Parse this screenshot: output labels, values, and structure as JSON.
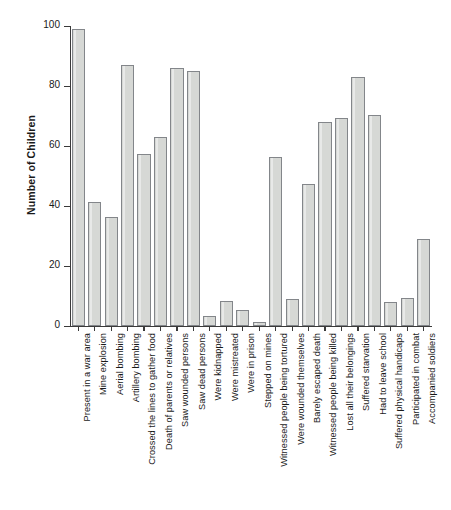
{
  "chart_data": {
    "type": "bar",
    "title": "",
    "xlabel": "",
    "ylabel": "Number of Children",
    "ylim": [
      0,
      100
    ],
    "yticks": [
      0,
      20,
      40,
      60,
      80,
      100
    ],
    "grid": false,
    "legend": null,
    "categories": [
      "Present in a war area",
      "Mine explosion",
      "Aerial bombing",
      "Artillery bombing",
      "Crossed the lines to gather food",
      "Death of parents or relatives",
      "Saw wounded persons",
      "Saw dead persons",
      "Were kidnapped",
      "Were mistreated",
      "Were in prison",
      "Stepped on mines",
      "Witnessed people being tortured",
      "Were wounded themselves",
      "Barely escaped death",
      "Witnessed people being killed",
      "Lost all their belongings",
      "Suffered starvation",
      "Had to leave school",
      "Suffered physical handicaps",
      "Participated in combat",
      "Accompanied soldiers"
    ],
    "values": [
      99,
      41.5,
      36.5,
      87,
      57.5,
      63,
      86,
      85,
      3.5,
      8.5,
      5.5,
      1.5,
      56.5,
      9,
      47.5,
      68,
      69.5,
      83,
      70.5,
      8,
      9.5,
      29
    ]
  },
  "axes": {
    "y_title": "Number of Children",
    "y_tick_labels": [
      "0",
      "20",
      "40",
      "60",
      "80",
      "100"
    ]
  },
  "style": {
    "bar_fill": "#d6d8d5",
    "bar_border": "#83868a",
    "axis_color": "#3a3a3a",
    "text_color": "#1a1a1a",
    "background": "#ffffff"
  }
}
